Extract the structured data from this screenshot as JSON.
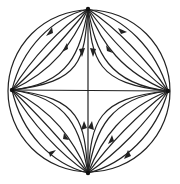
{
  "diagram": {
    "type": "phase-portrait",
    "colors": {
      "stroke": "#222222",
      "background": "#ffffff"
    },
    "geometry": {
      "center": [
        88,
        91
      ],
      "radius": 82,
      "nodes": {
        "top": [
          88,
          9
        ],
        "bottom": [
          88,
          173
        ],
        "left": [
          12,
          90
        ],
        "right": [
          168,
          91
        ]
      }
    },
    "flow": {
      "sources": [
        "top",
        "bottom"
      ],
      "sinks": [
        "left",
        "right"
      ],
      "saddle": "center"
    }
  }
}
